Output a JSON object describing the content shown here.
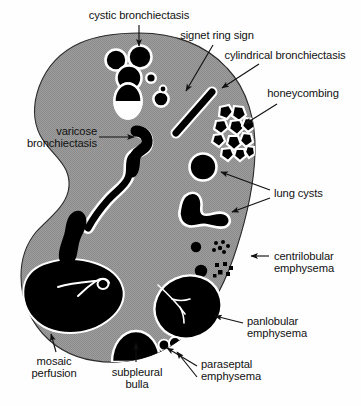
{
  "figure": {
    "title_alt": "Schematic cross-section of lung showing cystic and emphysematous patterns",
    "colors": {
      "lung_parenchyma": "#9a9a9a",
      "lesion_fill": "#000000",
      "outline_highlight": "#ffffff",
      "background": "#ffffff",
      "text": "#111111",
      "arrow": "#111111"
    }
  },
  "labels": [
    {
      "id": "cystic-bronchiectasis",
      "text": "cystic bronchiectasis",
      "x": 77,
      "y": 9,
      "w": 124,
      "align": "ctr"
    },
    {
      "id": "signet-ring-sign",
      "text": "signet ring sign",
      "x": 175,
      "y": 29,
      "w": 84,
      "align": "ctr"
    },
    {
      "id": "cylindrical-bronchiectasis",
      "text": "cylindrical bronchiectasis",
      "x": 212,
      "y": 49,
      "w": 146,
      "align": "ctr"
    },
    {
      "id": "honeycombing",
      "text": "honeycombing",
      "x": 262,
      "y": 87,
      "w": 82,
      "align": "ctr"
    },
    {
      "id": "varicose-bronchiectasis",
      "text": "varicose\nbronchiectasis",
      "x": 6,
      "y": 125,
      "w": 91,
      "align": "rgt"
    },
    {
      "id": "lung-cysts",
      "text": "lung cysts",
      "x": 272,
      "y": 187,
      "w": 64,
      "align": "lft"
    },
    {
      "id": "centrilobular-emphysema",
      "text": "centrilobular\nemphysema",
      "x": 272,
      "y": 250,
      "w": 86,
      "align": "lft"
    },
    {
      "id": "panlobular-emphysema",
      "text": "panlobular\nemphysema",
      "x": 245,
      "y": 315,
      "w": 80,
      "align": "lft"
    },
    {
      "id": "paraseptal-emphysema",
      "text": "paraseptal\nemphysema",
      "x": 200,
      "y": 357,
      "w": 80,
      "align": "lft"
    },
    {
      "id": "mosaic-perfusion",
      "text": "mosaic\nperfusion",
      "x": 22,
      "y": 355,
      "w": 64,
      "align": "ctr"
    },
    {
      "id": "subpleural-bulla",
      "text": "subpleural\nbulla",
      "x": 104,
      "y": 365,
      "w": 64,
      "align": "ctr"
    }
  ],
  "leaders": [
    {
      "id": "leader-cystic-bronchiectasis",
      "points": "139,25 139,47",
      "arrow": true
    },
    {
      "id": "leader-signet-ring-sign",
      "points": "213,45 185,92",
      "arrow": true
    },
    {
      "id": "leader-cylindrical-bronchiectasis",
      "points": "258,65 221,88",
      "arrow": true
    },
    {
      "id": "leader-honeycombing",
      "points": "275,105 243,123",
      "arrow": true
    },
    {
      "id": "leader-varicose-bronchiectasis",
      "points": "99,137 134,137",
      "arrow": true
    },
    {
      "id": "leader-lung-cysts-upper",
      "points": "268,190 222,172",
      "arrow": true
    },
    {
      "id": "leader-lung-cysts-lower",
      "points": "268,198 231,212",
      "arrow": true
    },
    {
      "id": "leader-centrilobular-emphysema",
      "points": "268,256 250,256",
      "arrow": true
    },
    {
      "id": "leader-panlobular-emphysema",
      "points": "243,323 214,316",
      "arrow": true
    },
    {
      "id": "leader-paraseptal-emphysema-a",
      "points": "197,367 166,348",
      "arrow": true
    },
    {
      "id": "leader-paraseptal-emphysema-b",
      "points": "197,377 176,351",
      "arrow": true
    },
    {
      "id": "leader-mosaic-perfusion",
      "points": "55,352 50,333",
      "arrow": true
    },
    {
      "id": "leader-subpleural-bulla",
      "points": "136,362 136,342",
      "arrow": true
    }
  ],
  "shapes": {
    "lung_outline_name": "lung-cross-section",
    "cystic_cluster": [
      {
        "cx": 116,
        "cy": 60,
        "r": 10
      },
      {
        "cx": 140,
        "cy": 57,
        "r": 11
      },
      {
        "cx": 129,
        "cy": 77,
        "r": 12
      },
      {
        "cx": 150,
        "cy": 77,
        "r": 4.5
      }
    ],
    "cystic_air_fluid": {
      "cx": 128,
      "cy": 101,
      "rx": 13,
      "ry": 17,
      "fluid_top_ratio": 0.52
    },
    "signet_ring": {
      "cx": 161,
      "cy": 98,
      "r": 7,
      "dot_cx": 163,
      "dot_cy": 89,
      "dot_r": 3
    },
    "cylindrical_bar": {
      "x1": 211,
      "y1": 93,
      "x2": 176,
      "y2": 131,
      "width": 7
    },
    "honeycomb_cells": 12,
    "round_cyst": {
      "cx": 203,
      "cy": 167,
      "r": 13
    },
    "centrilobular_dots": [
      {
        "cx": 196,
        "cy": 247,
        "r": 5
      },
      {
        "cx": 201,
        "cy": 270,
        "r": 6
      }
    ],
    "centrilobular_clusters": 2,
    "paraseptal_blobs": [
      {
        "cx": 163,
        "cy": 345,
        "r": 5
      },
      {
        "cx": 174,
        "cy": 344,
        "r": 5.5
      }
    ],
    "subpleural_bulla": {
      "cx": 136,
      "cy": 345,
      "rx": 24,
      "ry": 19
    }
  }
}
